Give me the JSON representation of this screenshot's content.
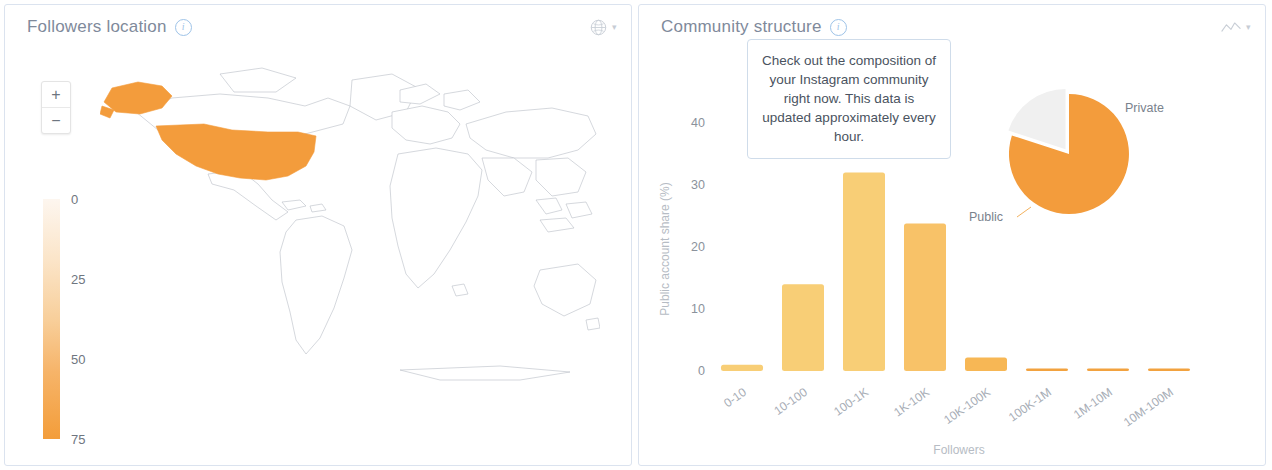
{
  "theme": {
    "orange": "#f39c3c",
    "bar_amber": "#f8ce76",
    "bar_amber_dark": "#f5a93f",
    "panel_border": "#dbe3ef",
    "title_color": "#7f8a9b",
    "pie_private": "#f0f0f0"
  },
  "panels": {
    "followers_location": {
      "title": "Followers location",
      "info_icon": "info-circle-icon",
      "header_icon": "globe-icon",
      "header_caret": "▾",
      "zoom_in_label": "+",
      "zoom_out_label": "−",
      "legend": {
        "ticks": [
          "0",
          "25",
          "50",
          "75"
        ],
        "min": 0,
        "max": 75
      },
      "highlighted_regions": [
        "United States",
        "Alaska"
      ]
    },
    "community_structure": {
      "title": "Community structure",
      "info_icon": "info-circle-icon",
      "header_icon": "line-chart-icon",
      "header_caret": "▾",
      "tooltip": "Check out the composition of your Instagram community right now. This data is updated approximately every hour.",
      "pie_labels": {
        "private": "Private",
        "public": "Public"
      }
    }
  },
  "chart_data": [
    {
      "type": "bar",
      "title": "Community structure",
      "categories": [
        "0-10",
        "10-100",
        "100-1K",
        "1K-10K",
        "10K-100K",
        "100K-1M",
        "1M-10M",
        "10M-100M"
      ],
      "values": [
        1.0,
        14.0,
        32.0,
        23.8,
        2.2,
        0.4,
        0.4,
        0.4
      ],
      "xlabel": "Followers",
      "ylabel": "Public account share (%)",
      "yticks": [
        0,
        10,
        20,
        30,
        40
      ],
      "ylim": [
        0,
        44
      ],
      "grid": false,
      "legend": "none",
      "bar_color": "#f8ce76"
    },
    {
      "type": "pie",
      "labels": [
        "Public",
        "Private"
      ],
      "values": [
        80,
        20
      ],
      "colors": [
        "#f39c3c",
        "#f0f0f0"
      ],
      "exploded": [
        "Private"
      ],
      "legend": "labels-outside"
    }
  ]
}
